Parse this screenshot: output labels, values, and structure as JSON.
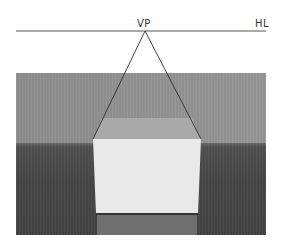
{
  "labels": {
    "vanishing_point": "VP",
    "horizon_line": "HL"
  },
  "colors": {
    "background": "#ffffff",
    "line": "#3a3a3a",
    "wall": "#909090",
    "table": "#484848",
    "box_front": "#e8e8e8",
    "box_top": "#a8a8a8",
    "reflection": "#6e6e6e",
    "text": "#333333"
  },
  "geometry": {
    "horizon_y": 31,
    "horizon_x_start": 16,
    "horizon_x_end": 266,
    "vp": [
      145,
      31
    ],
    "box_front_top_left": [
      93,
      139
    ],
    "box_front_top_right": [
      201,
      139
    ]
  }
}
